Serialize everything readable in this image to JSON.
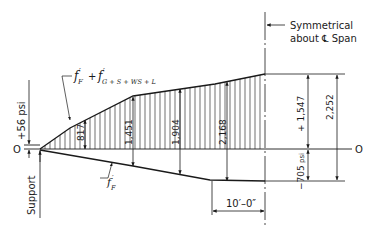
{
  "diagram": {
    "labels": {
      "symmetry_line1": "Symmetrical",
      "symmetry_line2": "about ℄ Span",
      "top_curve_label_main": "f",
      "top_curve_label_F": "F",
      "top_curve_label_plus": "+",
      "top_curve_label_G": "G + S + WS + L",
      "prime": "′",
      "bottom_curve_label_f": "f",
      "bottom_curve_label_F": "F",
      "support": "Support",
      "zero_left": "O",
      "zero_right": "O",
      "support_stress": "+56 psi",
      "dim_817": "817",
      "dim_1451": "1,451",
      "dim_1904": "1,904",
      "dim_2168": "2,168",
      "dim_top": "+ 1,547",
      "dim_bottom": "−705",
      "dim_bottom_unit": "psi",
      "dim_total": "2,252",
      "dim_length": "10′–0″"
    },
    "values": {
      "support_stress_psi": 56,
      "ordinates": [
        817,
        1451,
        1904,
        2168
      ],
      "top_fiber_at_midspan_psi": 1547,
      "bottom_fiber_at_midspan_psi": -705,
      "total_range_psi": 2252,
      "constant_segment_length": "10'-0\""
    },
    "colors": {
      "line": "#1a1a1a",
      "hatch": "#333333",
      "background": "#ffffff"
    }
  }
}
